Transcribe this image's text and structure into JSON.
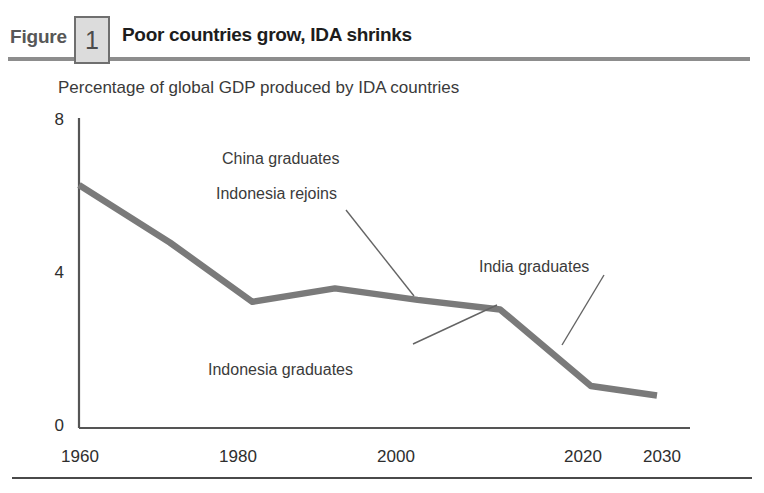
{
  "header": {
    "figure_word": "Figure",
    "figure_number": "1",
    "title": "Poor countries grow, IDA shrinks"
  },
  "chart_data": {
    "type": "line",
    "title": "Poor countries grow, IDA shrinks",
    "subtitle": "Percentage of global GDP produced by IDA countries",
    "xlabel": "",
    "ylabel": "",
    "xlim": [
      1960,
      2034
    ],
    "ylim": [
      0,
      8
    ],
    "grid": false,
    "legend": "none",
    "x_ticks": [
      1960,
      1980,
      2000,
      2020,
      2030
    ],
    "x_tick_labels": [
      "1960",
      "1980",
      "2000",
      "2020",
      "2030"
    ],
    "y_ticks": [
      0,
      4,
      8
    ],
    "y_tick_labels": [
      "0",
      "4",
      "8"
    ],
    "series": [
      {
        "name": "Percentage of global GDP produced by IDA countries",
        "color": "#7a7a7a",
        "x": [
          1960,
          1971,
          1981,
          1991,
          2001,
          2011,
          2022,
          2030
        ],
        "values": [
          6.35,
          4.85,
          3.3,
          3.65,
          3.35,
          3.1,
          1.1,
          0.85
        ]
      }
    ],
    "annotations": [
      {
        "id": "china-graduates",
        "text": "China graduates",
        "x_px": 222,
        "y_px": 150
      },
      {
        "id": "indonesia-rejoins",
        "text": "Indonesia rejoins",
        "x_px": 216,
        "y_px": 185
      },
      {
        "id": "indonesia-graduates",
        "text": "Indonesia graduates",
        "x_px": 208,
        "y_px": 361
      },
      {
        "id": "india-graduates",
        "text": "India graduates",
        "x_px": 479,
        "y_px": 258
      }
    ],
    "leader_lines": [
      {
        "id": "china-indonesia-leader",
        "from": [
          346,
          210
        ],
        "to": [
          414,
          296
        ]
      },
      {
        "id": "indonesia-graduates-leader",
        "from": [
          413,
          344
        ],
        "to": [
          497,
          305
        ]
      },
      {
        "id": "india-graduates-leader",
        "from": [
          562,
          345
        ],
        "to": [
          604,
          275
        ]
      }
    ],
    "axis_color": "#555555",
    "line_color": "#7a7a7a"
  },
  "colors": {
    "line": "#7a7a7a",
    "axis": "#555555",
    "header_rule": "#8d8d8d",
    "footer_rule": "#4a4a4a",
    "title_text": "#1d1d1d",
    "figure_word": "#575757",
    "number_box_fill": "#dcdcdc",
    "number_box_border": "#6f6f6f"
  }
}
